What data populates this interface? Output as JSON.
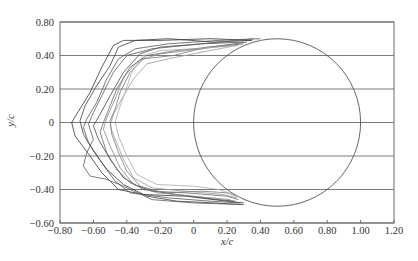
{
  "chart_data": {
    "type": "line",
    "title": "",
    "xlabel": "x/c",
    "ylabel": "y/c",
    "xlim": [
      -0.8,
      1.2
    ],
    "ylim": [
      -0.6,
      0.6
    ],
    "grid": "horizontal",
    "legend": "none",
    "x_ticks": [
      {
        "value": -0.8,
        "label": "−0.80"
      },
      {
        "value": -0.6,
        "label": "−0.60"
      },
      {
        "value": -0.4,
        "label": "−0.40"
      },
      {
        "value": -0.2,
        "label": "−0.20"
      },
      {
        "value": 0.0,
        "label": "0"
      },
      {
        "value": 0.2,
        "label": "0.20"
      },
      {
        "value": 0.4,
        "label": "0.40"
      },
      {
        "value": 0.6,
        "label": "0.60"
      },
      {
        "value": 0.8,
        "label": "0.80"
      },
      {
        "value": 1.0,
        "label": "1.00"
      },
      {
        "value": 1.2,
        "label": "1.20"
      }
    ],
    "y_ticks": [
      {
        "value": 0.6,
        "label": "0.80"
      },
      {
        "value": 0.4,
        "label": "0.40"
      },
      {
        "value": 0.2,
        "label": "0.20"
      },
      {
        "value": 0.0,
        "label": "0"
      },
      {
        "value": -0.2,
        "label": "−0.20"
      },
      {
        "value": -0.4,
        "label": "−0.40"
      },
      {
        "value": -0.6,
        "label": "−0.60"
      }
    ],
    "circle": {
      "name": "cylinder",
      "cx": 0.5,
      "cy": 0.0,
      "r": 0.5
    },
    "series": [
      {
        "name": "trace-1",
        "color": "#333333",
        "points": [
          [
            0.35,
            0.49
          ],
          [
            0.1,
            0.5
          ],
          [
            -0.2,
            0.49
          ],
          [
            -0.42,
            0.49
          ],
          [
            -0.48,
            0.46
          ],
          [
            -0.55,
            0.33
          ],
          [
            -0.62,
            0.18
          ],
          [
            -0.7,
            0.05
          ],
          [
            -0.73,
            0.0
          ],
          [
            -0.71,
            -0.08
          ],
          [
            -0.62,
            -0.2
          ],
          [
            -0.55,
            -0.3
          ],
          [
            -0.45,
            -0.4
          ],
          [
            -0.3,
            -0.43
          ],
          [
            -0.05,
            -0.44
          ],
          [
            0.2,
            -0.47
          ],
          [
            0.3,
            -0.48
          ]
        ]
      },
      {
        "name": "trace-2",
        "color": "#555555",
        "points": [
          [
            0.4,
            0.5
          ],
          [
            0.15,
            0.49
          ],
          [
            -0.15,
            0.47
          ],
          [
            -0.35,
            0.44
          ],
          [
            -0.45,
            0.38
          ],
          [
            -0.52,
            0.26
          ],
          [
            -0.58,
            0.12
          ],
          [
            -0.64,
            0.02
          ],
          [
            -0.66,
            -0.03
          ],
          [
            -0.63,
            -0.12
          ],
          [
            -0.55,
            -0.24
          ],
          [
            -0.47,
            -0.35
          ],
          [
            -0.38,
            -0.42
          ],
          [
            -0.15,
            -0.45
          ],
          [
            0.1,
            -0.47
          ],
          [
            0.28,
            -0.48
          ]
        ]
      },
      {
        "name": "trace-3",
        "color": "#444444",
        "points": [
          [
            0.3,
            0.48
          ],
          [
            0.05,
            0.47
          ],
          [
            -0.2,
            0.45
          ],
          [
            -0.32,
            0.41
          ],
          [
            -0.42,
            0.3
          ],
          [
            -0.5,
            0.16
          ],
          [
            -0.56,
            0.05
          ],
          [
            -0.6,
            -0.02
          ],
          [
            -0.57,
            -0.1
          ],
          [
            -0.5,
            -0.22
          ],
          [
            -0.42,
            -0.33
          ],
          [
            -0.3,
            -0.4
          ],
          [
            -0.1,
            -0.43
          ],
          [
            0.15,
            -0.46
          ],
          [
            0.25,
            -0.47
          ]
        ]
      },
      {
        "name": "trace-4",
        "color": "#888888",
        "points": [
          [
            0.28,
            0.47
          ],
          [
            0.05,
            0.44
          ],
          [
            -0.2,
            0.41
          ],
          [
            -0.33,
            0.37
          ],
          [
            -0.42,
            0.27
          ],
          [
            -0.47,
            0.14
          ],
          [
            -0.52,
            0.03
          ],
          [
            -0.54,
            -0.04
          ],
          [
            -0.5,
            -0.14
          ],
          [
            -0.44,
            -0.27
          ],
          [
            -0.36,
            -0.37
          ],
          [
            -0.22,
            -0.42
          ],
          [
            0.0,
            -0.44
          ],
          [
            0.22,
            -0.46
          ]
        ]
      },
      {
        "name": "trace-5",
        "color": "#666666",
        "points": [
          [
            0.32,
            0.48
          ],
          [
            0.1,
            0.45
          ],
          [
            -0.1,
            0.43
          ],
          [
            -0.28,
            0.4
          ],
          [
            -0.38,
            0.33
          ],
          [
            -0.46,
            0.2
          ],
          [
            -0.5,
            0.1
          ],
          [
            -0.54,
            0.0
          ],
          [
            -0.56,
            -0.06
          ],
          [
            -0.52,
            -0.18
          ],
          [
            -0.46,
            -0.28
          ],
          [
            -0.38,
            -0.36
          ],
          [
            -0.25,
            -0.41
          ],
          [
            -0.05,
            -0.42
          ],
          [
            0.2,
            -0.44
          ],
          [
            0.27,
            -0.46
          ]
        ]
      },
      {
        "name": "trace-6",
        "color": "#999999",
        "points": [
          [
            0.26,
            0.46
          ],
          [
            0.05,
            0.42
          ],
          [
            -0.15,
            0.38
          ],
          [
            -0.28,
            0.35
          ],
          [
            -0.36,
            0.26
          ],
          [
            -0.43,
            0.14
          ],
          [
            -0.48,
            0.05
          ],
          [
            -0.5,
            -0.02
          ],
          [
            -0.47,
            -0.1
          ],
          [
            -0.42,
            -0.22
          ],
          [
            -0.36,
            -0.33
          ],
          [
            -0.25,
            -0.39
          ],
          [
            -0.05,
            -0.41
          ],
          [
            0.18,
            -0.43
          ],
          [
            0.26,
            -0.45
          ]
        ]
      },
      {
        "name": "trace-7",
        "color": "#3c3c3c",
        "points": [
          [
            0.34,
            0.49
          ],
          [
            0.12,
            0.48
          ],
          [
            -0.15,
            0.5
          ],
          [
            -0.35,
            0.49
          ],
          [
            -0.45,
            0.45
          ],
          [
            -0.5,
            0.34
          ],
          [
            -0.58,
            0.22
          ],
          [
            -0.65,
            0.1
          ],
          [
            -0.68,
            0.01
          ],
          [
            -0.66,
            -0.07
          ],
          [
            -0.6,
            -0.17
          ],
          [
            -0.52,
            -0.28
          ],
          [
            -0.42,
            -0.37
          ],
          [
            -0.28,
            -0.44
          ],
          [
            -0.1,
            -0.47
          ],
          [
            0.12,
            -0.48
          ],
          [
            0.3,
            -0.49
          ]
        ]
      },
      {
        "name": "trace-8",
        "color": "#777777",
        "points": [
          [
            0.3,
            0.47
          ],
          [
            0.08,
            0.45
          ],
          [
            -0.12,
            0.4
          ],
          [
            -0.3,
            0.38
          ],
          [
            -0.38,
            0.3
          ],
          [
            -0.44,
            0.18
          ],
          [
            -0.47,
            0.08
          ],
          [
            -0.5,
            0.01
          ],
          [
            -0.49,
            -0.07
          ],
          [
            -0.45,
            -0.18
          ],
          [
            -0.4,
            -0.29
          ],
          [
            -0.32,
            -0.38
          ],
          [
            -0.18,
            -0.42
          ],
          [
            0.05,
            -0.41
          ],
          [
            0.2,
            -0.42
          ],
          [
            0.26,
            -0.44
          ]
        ]
      },
      {
        "name": "trace-9",
        "color": "#5a5a5a",
        "points": [
          [
            0.36,
            0.5
          ],
          [
            0.15,
            0.48
          ],
          [
            -0.05,
            0.46
          ],
          [
            -0.25,
            0.44
          ],
          [
            -0.4,
            0.4
          ],
          [
            -0.48,
            0.3
          ],
          [
            -0.55,
            0.16
          ],
          [
            -0.6,
            0.06
          ],
          [
            -0.63,
            -0.01
          ],
          [
            -0.6,
            -0.1
          ],
          [
            -0.64,
            -0.18
          ],
          [
            -0.66,
            -0.26
          ],
          [
            -0.62,
            -0.32
          ],
          [
            -0.52,
            -0.34
          ],
          [
            -0.42,
            -0.38
          ],
          [
            -0.25,
            -0.46
          ],
          [
            0.0,
            -0.48
          ],
          [
            0.29,
            -0.49
          ]
        ]
      },
      {
        "name": "trace-10",
        "color": "#aaaaaa",
        "points": [
          [
            0.27,
            0.46
          ],
          [
            0.0,
            0.44
          ],
          [
            -0.2,
            0.43
          ],
          [
            -0.3,
            0.4
          ],
          [
            -0.37,
            0.3
          ],
          [
            -0.41,
            0.18
          ],
          [
            -0.45,
            0.07
          ],
          [
            -0.47,
            0.0
          ],
          [
            -0.45,
            -0.08
          ],
          [
            -0.4,
            -0.2
          ],
          [
            -0.34,
            -0.31
          ],
          [
            -0.22,
            -0.37
          ],
          [
            0.0,
            -0.38
          ],
          [
            0.15,
            -0.4
          ],
          [
            0.24,
            -0.43
          ]
        ]
      }
    ]
  }
}
